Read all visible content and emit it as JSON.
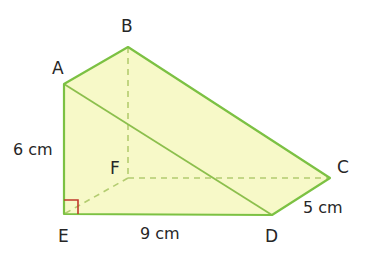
{
  "figure": {
    "kind": "triangular-prism-net-diagram",
    "background_color": "#ffffff",
    "fill_color": "#f7f9c8",
    "edge_color": "#7cc143",
    "hidden_edge_color": "#a9c96a",
    "right_angle_color": "#c0392b",
    "text_color": "#262626"
  },
  "vertices": {
    "A": {
      "label": "A",
      "x": 64,
      "y": 84
    },
    "B": {
      "label": "B",
      "x": 128,
      "y": 47
    },
    "C": {
      "label": "C",
      "x": 330,
      "y": 178
    },
    "D": {
      "label": "D",
      "x": 272,
      "y": 215
    },
    "E": {
      "label": "E",
      "x": 64,
      "y": 214
    },
    "F": {
      "label": "F",
      "x": 128,
      "y": 178
    }
  },
  "dimensions": {
    "height": "6 cm",
    "length": "9 cm",
    "depth": "5 cm"
  },
  "edges": {
    "solid": [
      "A-B",
      "B-C",
      "C-D",
      "D-E",
      "E-A",
      "A-D"
    ],
    "hidden_dashed": [
      "B-F",
      "F-E",
      "F-C"
    ]
  },
  "markers": {
    "right_angle_at": "E"
  }
}
